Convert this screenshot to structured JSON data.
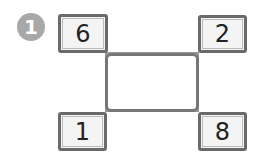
{
  "problem": {
    "number": "1",
    "corners": {
      "top_left": "6",
      "top_right": "2",
      "bottom_left": "1",
      "bottom_right": "8"
    },
    "center_answer": ""
  }
}
